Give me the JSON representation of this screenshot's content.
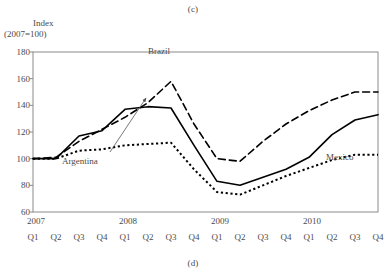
{
  "figure": {
    "panel_tag_top": "(c)",
    "panel_tag_bottom": "(d)"
  },
  "axes": {
    "ylabel_line1": "Index",
    "ylabel_line2": "(2007=100)",
    "yticks": [
      "180",
      "160",
      "140",
      "120",
      "100",
      "80",
      "60"
    ],
    "years": [
      "2007",
      "2008",
      "2009",
      "2010"
    ],
    "quarters": [
      "Q1",
      "Q2",
      "Q3",
      "Q4",
      "Q1",
      "Q2",
      "Q3",
      "Q4",
      "Q1",
      "Q2",
      "Q3",
      "Q4",
      "Q1",
      "Q2",
      "Q3",
      "Q4"
    ]
  },
  "annotations": {
    "brazil": "Brazil",
    "argentina": "Argentina",
    "mexico": "Mexico"
  },
  "chart_data": {
    "type": "line",
    "title": "(c)",
    "xlabel": "",
    "ylabel": "Index (2007=100)",
    "ylim": [
      60,
      180
    ],
    "ytick_step": 20,
    "grid": false,
    "legend_position": "inline-annotations",
    "x": [
      "2007 Q1",
      "2007 Q2",
      "2007 Q3",
      "2007 Q4",
      "2008 Q1",
      "2008 Q2",
      "2008 Q3",
      "2008 Q4",
      "2009 Q1",
      "2009 Q2",
      "2009 Q3",
      "2009 Q4",
      "2010 Q1",
      "2010 Q2",
      "2010 Q3",
      "2010 Q4"
    ],
    "series": [
      {
        "name": "Brazil",
        "style": "dashed",
        "color": "#000000",
        "values": [
          100,
          101,
          113,
          122,
          131,
          142,
          158,
          126,
          100,
          98,
          113,
          126,
          136,
          144,
          150,
          150
        ]
      },
      {
        "name": "Argentina",
        "style": "solid",
        "color": "#000000",
        "values": [
          100,
          100,
          117,
          121,
          137,
          139,
          138,
          110,
          83,
          80,
          86,
          92,
          101,
          118,
          129,
          133
        ]
      },
      {
        "name": "Mexico",
        "style": "dotted",
        "color": "#000000",
        "values": [
          100,
          100,
          106,
          107,
          110,
          111,
          112,
          92,
          75,
          73,
          80,
          87,
          93,
          99,
          103,
          103
        ]
      }
    ]
  }
}
